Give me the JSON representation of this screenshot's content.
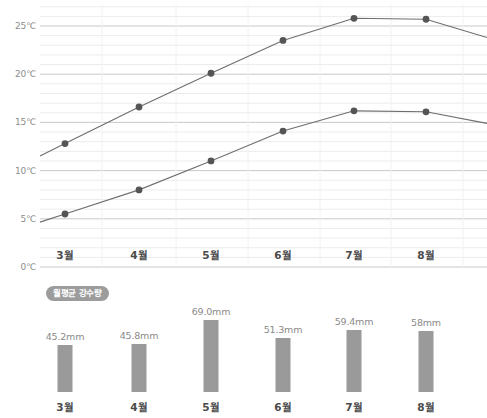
{
  "chart_data": [
    {
      "type": "line",
      "title": "",
      "xlabel": "",
      "ylabel": "",
      "ylim": [
        0,
        27.5
      ],
      "grid": true,
      "legend_position": "none",
      "categories": [
        "3월",
        "4월",
        "5월",
        "6월",
        "7월",
        "8월"
      ],
      "y_ticks": [
        {
          "value": 0,
          "label": "0℃"
        },
        {
          "value": 5,
          "label": "5℃"
        },
        {
          "value": 10,
          "label": "10℃"
        },
        {
          "value": 15,
          "label": "15℃"
        },
        {
          "value": 20,
          "label": "20℃"
        },
        {
          "value": 25,
          "label": "25℃"
        }
      ],
      "series": [
        {
          "name": "최고기온",
          "values": [
            12.8,
            16.6,
            20.1,
            23.5,
            25.8,
            25.7
          ],
          "color": "#6e6e6e"
        },
        {
          "name": "최저기온",
          "values": [
            5.5,
            8.0,
            11.0,
            14.1,
            16.2,
            16.1
          ],
          "color": "#6e6e6e"
        }
      ]
    },
    {
      "type": "bar",
      "title": "월평균 강수량",
      "xlabel": "",
      "ylabel": "",
      "ylim": [
        0,
        80
      ],
      "grid": false,
      "legend_position": "top-left",
      "categories": [
        "3월",
        "4월",
        "5월",
        "6월",
        "7월",
        "8월"
      ],
      "values": [
        45.2,
        45.8,
        69.0,
        51.3,
        59.4,
        58
      ],
      "value_labels": [
        "45.2mm",
        "45.8mm",
        "69.0mm",
        "51.3mm",
        "59.4mm",
        "58mm"
      ],
      "bar_color": "#9a9a9a"
    }
  ],
  "line_chart": {
    "y_tick_labels": [
      "0℃",
      "5℃",
      "10℃",
      "15℃",
      "20℃",
      "25℃"
    ],
    "x_tick_labels": [
      "3월",
      "4월",
      "5월",
      "6월",
      "7월",
      "8월"
    ]
  },
  "bar_chart": {
    "legend_label": "월평균 강수량",
    "bars": [
      {
        "label": "3월",
        "value_label": "45.2mm"
      },
      {
        "label": "4월",
        "value_label": "45.8mm"
      },
      {
        "label": "5월",
        "value_label": "69.0mm"
      },
      {
        "label": "6월",
        "value_label": "51.3mm"
      },
      {
        "label": "7월",
        "value_label": "59.4mm"
      },
      {
        "label": "8월",
        "value_label": "58mm"
      }
    ]
  },
  "colors": {
    "line": "#6e6e6e",
    "marker": "#555555",
    "major_grid": "#c9c9c9",
    "minor_grid": "#ececec",
    "bar": "#9a9a9a",
    "badge": "#9c9c9c",
    "axis_text": "#8c8c8c",
    "label_text": "#4a4a4a"
  }
}
